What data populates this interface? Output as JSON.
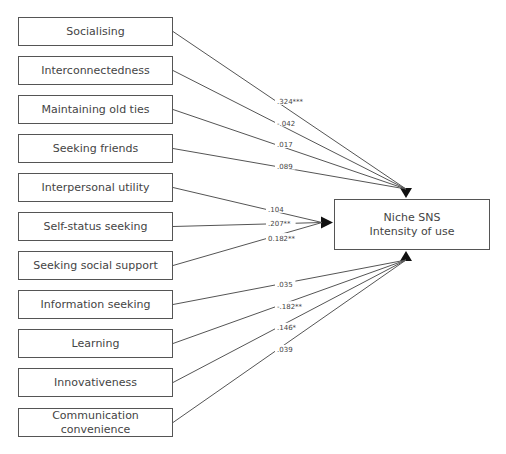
{
  "diagram": {
    "type": "path-model",
    "target": {
      "line1": "Niche SNS",
      "line2": "Intensity of use",
      "x": 334,
      "y": 199,
      "w": 156,
      "h": 51
    },
    "predictors": [
      {
        "label": "Socialising",
        "coef": ".324***",
        "y": 17
      },
      {
        "label": "Interconnectedness",
        "coef": "-.042",
        "y": 56
      },
      {
        "label": "Maintaining old ties",
        "coef": ".017",
        "y": 95
      },
      {
        "label": "Seeking friends",
        "coef": ".089",
        "y": 134
      },
      {
        "label": "Interpersonal utility",
        "coef": ".104",
        "y": 173
      },
      {
        "label": "Self-status seeking",
        "coef": ".207**",
        "y": 212
      },
      {
        "label": "Seeking social support",
        "coef": "0.182**",
        "y": 251
      },
      {
        "label": "Information seeking",
        "coef": ".035",
        "y": 290
      },
      {
        "label": "Learning",
        "coef": "-.182**",
        "y": 329
      },
      {
        "label": "Innovativeness",
        "coef": ".146*",
        "y": 368
      },
      {
        "label": "Communication convenience",
        "coef": ".039",
        "y": 408
      }
    ],
    "box": {
      "x": 18,
      "w": 155,
      "h": 29
    },
    "colors": {
      "line": "#555555",
      "text": "#444444",
      "arrow": "#111111"
    }
  }
}
